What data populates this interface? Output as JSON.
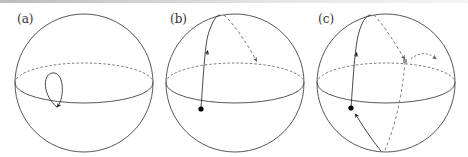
{
  "figure": {
    "panels": [
      {
        "label": "(a)",
        "description": "small closed loop on sphere near equator"
      },
      {
        "label": "(b)",
        "description": "path from equator point up over pole, continuing dashed on back side"
      },
      {
        "label": "(c)",
        "description": "path around sphere crossing equator, continuing dashed with further dashed curve"
      }
    ],
    "colors": {
      "stroke": "#444444",
      "dashed": "#666666",
      "point": "#000000"
    }
  }
}
